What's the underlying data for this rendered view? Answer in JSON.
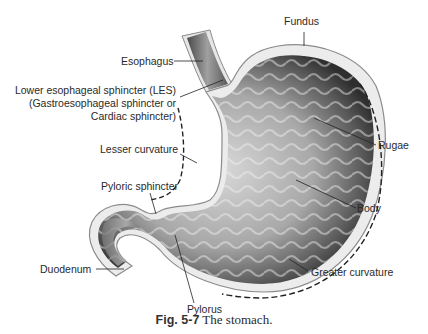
{
  "figure": {
    "caption_number": "Fig. 5-7",
    "caption_text": "The stomach."
  },
  "labels": {
    "fundus": "Fundus",
    "esophagus": "Esophagus",
    "les_line1": "Lower esophageal sphincter (LES)",
    "les_line2": "(Gastroesophageal sphincter or",
    "les_line3": "Cardiac sphincter)",
    "lesser_curvature": "Lesser curvature",
    "rugae": "Rugae",
    "pyloric_sphincter": "Pyloric sphincter",
    "body": "Body",
    "duodenum": "Duodenum",
    "greater_curvature": "Greater curvature",
    "pylorus": "Pylorus"
  },
  "colors": {
    "wall_outer": "#9a9a9a",
    "wall_fill": "#e9e9e9",
    "lumen_dark": "#3a3a3a",
    "lumen_light": "#cfcfcf",
    "leader_line": "#222222",
    "text": "#2a2a2a"
  }
}
